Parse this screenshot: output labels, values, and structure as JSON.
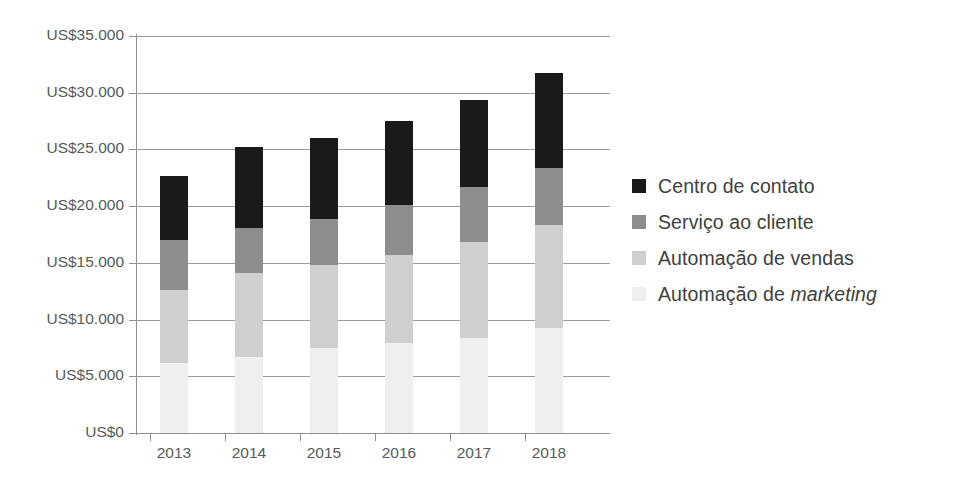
{
  "chart_data": {
    "type": "bar",
    "stacked": true,
    "title": "",
    "subtitle": "",
    "xlabel": "",
    "ylabel": "",
    "categories": [
      "2013",
      "2014",
      "2015",
      "2016",
      "2017",
      "2018"
    ],
    "ylim": [
      0,
      35000
    ],
    "ytick_values": [
      0,
      5000,
      10000,
      15000,
      20000,
      25000,
      30000,
      35000
    ],
    "ytick_labels": [
      "US$0",
      "US$5.000",
      "US$10.000",
      "US$15.000",
      "US$20.000",
      "US$25.000",
      "US$30.000",
      "US$35.000"
    ],
    "grid": true,
    "legend_position": "right",
    "currency_prefix": "US$",
    "series": [
      {
        "name": "Centro de contato",
        "color": "#1a1a1a",
        "values": [
          5700,
          7100,
          7100,
          7400,
          7700,
          8300
        ]
      },
      {
        "name": "Serviço ao cliente",
        "color": "#8d8d8d",
        "values": [
          4400,
          4000,
          4100,
          4400,
          4900,
          5100
        ]
      },
      {
        "name": "Automação de vendas",
        "color": "#cfcfcf",
        "values": [
          6400,
          7400,
          7300,
          7800,
          8400,
          9000
        ]
      },
      {
        "name": "Automação de marketing",
        "color": "#efefef",
        "values": [
          6200,
          6700,
          7500,
          7900,
          8400,
          9300
        ]
      }
    ],
    "totals": [
      22700,
      24300,
      26000,
      27800,
      29400,
      31700
    ]
  },
  "legend": {
    "items": [
      {
        "label": "Centro de contato",
        "label_italic": "",
        "color": "#1a1a1a"
      },
      {
        "label": "Serviço ao cliente",
        "label_italic": "",
        "color": "#8d8d8d"
      },
      {
        "label": "Automação de vendas",
        "label_italic": "",
        "color": "#cfcfcf"
      },
      {
        "label": "Automação de ",
        "label_italic": "marketing",
        "color": "#efefef"
      }
    ]
  },
  "axis": {
    "y_labels": [
      "US$35.000",
      "US$30.000",
      "US$25.000",
      "US$20.000",
      "US$15.000",
      "US$10.000",
      "US$5.000",
      "US$0"
    ],
    "x_labels": [
      "2013",
      "2014",
      "2015",
      "2016",
      "2017",
      "2018"
    ]
  },
  "colors": {
    "grid": "#9a9a9a",
    "axis": "#8f8f8f",
    "text": "#58595b",
    "legend_text": "#3f3f3f",
    "background": "#ffffff"
  }
}
